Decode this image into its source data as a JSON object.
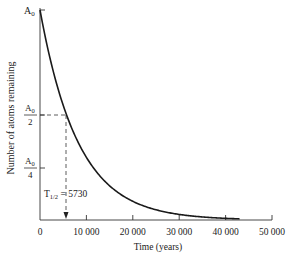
{
  "chart_data": {
    "type": "line",
    "title": "",
    "xlabel": "Time (years)",
    "ylabel": "Number of atoms remaining",
    "xlim": [
      0,
      50000
    ],
    "ylim": [
      0,
      1
    ],
    "grid": false,
    "legend": null,
    "x_ticks": [
      "0",
      "10 000",
      "20 000",
      "30 000",
      "40 000",
      "50 000"
    ],
    "x_tick_values": [
      0,
      10000,
      20000,
      30000,
      40000,
      50000
    ],
    "y_ticks": [
      {
        "label_num": "A",
        "label_sub": "0",
        "denominator": "",
        "value": 1.0
      },
      {
        "label_num": "A",
        "label_sub": "0",
        "denominator": "2",
        "value": 0.5
      },
      {
        "label_num": "A",
        "label_sub": "0",
        "denominator": "4",
        "value": 0.25
      }
    ],
    "series": [
      {
        "name": "Carbon-14 decay",
        "half_life": 5730,
        "x": [
          0,
          2865,
          5730,
          8595,
          11460,
          17190,
          22920,
          28650,
          34380,
          40110,
          43000
        ],
        "values": [
          1.0,
          0.707,
          0.5,
          0.354,
          0.25,
          0.125,
          0.0625,
          0.03125,
          0.0156,
          0.0078,
          0.0055
        ]
      }
    ],
    "annotations": [
      {
        "text_main": "T",
        "text_sub": "1/2",
        "text_rest": " = 5730",
        "x": 5730,
        "type": "dashed-guide-with-arrow"
      }
    ]
  }
}
